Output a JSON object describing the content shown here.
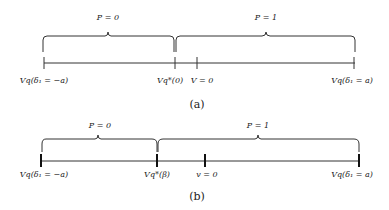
{
  "panels": [
    {
      "id": "a",
      "caption": "(a)",
      "regions": [
        {
          "label": "P = 0"
        },
        {
          "label": "P = 1"
        }
      ],
      "points": [
        {
          "label": "Vq(δ₁ = −a)"
        },
        {
          "label": "Vq*(0)"
        },
        {
          "label": "V = 0"
        },
        {
          "label": "Vq(δ₁ = a)"
        }
      ]
    },
    {
      "id": "b",
      "caption": "(b)",
      "regions": [
        {
          "label": "P = 0"
        },
        {
          "label": "P = 1"
        }
      ],
      "points": [
        {
          "label": "Vq(δ₁ = −a)"
        },
        {
          "label": "Vq*(β)"
        },
        {
          "label": "v = 0"
        },
        {
          "label": "Vq(δ₁ = a)"
        }
      ]
    }
  ]
}
